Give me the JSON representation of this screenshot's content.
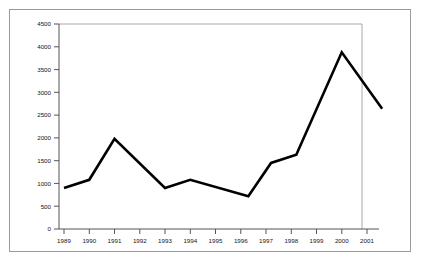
{
  "chart_data": {
    "type": "line",
    "title": "",
    "xlabel": "",
    "ylabel": "",
    "xlim": [
      1989,
      2001.6
    ],
    "ylim": [
      0,
      4500
    ],
    "grid": false,
    "legend": false,
    "legend_position": "none",
    "line_color": "#000000",
    "frame_color": "#a8a8a8",
    "axis_color": "#555555",
    "x_tick_labels": [
      "1989",
      "1990",
      "1991",
      "1992",
      "1993",
      "1994",
      "1995",
      "1996",
      "1997",
      "1998",
      "1999",
      "2000",
      "2001"
    ],
    "y_tick_labels": [
      "0",
      "500",
      "1000",
      "1500",
      "2000",
      "2500",
      "3000",
      "3500",
      "4000",
      "4500"
    ],
    "y_ticks": [
      0,
      500,
      1000,
      1500,
      2000,
      2500,
      3000,
      3500,
      4000,
      4500
    ],
    "x": [
      1989,
      1990,
      1991,
      1993,
      1994,
      1996.3,
      1997.2,
      1998.2,
      2000,
      2001.6
    ],
    "values": [
      900,
      1080,
      1980,
      900,
      1080,
      720,
      1450,
      1630,
      3880,
      2640
    ],
    "points": [
      {
        "x": 1989,
        "y": 900
      },
      {
        "x": 1990,
        "y": 1080
      },
      {
        "x": 1991,
        "y": 1980
      },
      {
        "x": 1993,
        "y": 900
      },
      {
        "x": 1994,
        "y": 1080
      },
      {
        "x": 1996.3,
        "y": 720
      },
      {
        "x": 1997.2,
        "y": 1450
      },
      {
        "x": 1998.2,
        "y": 1630
      },
      {
        "x": 2000,
        "y": 3880
      },
      {
        "x": 2001.6,
        "y": 2640
      }
    ]
  }
}
